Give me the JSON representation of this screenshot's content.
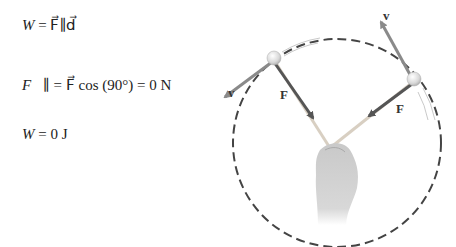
{
  "equations": {
    "eq1": {
      "lhs": "W",
      "rhs": "= F⃗∥d⃗"
    },
    "eq2": {
      "lhs": "F⃗∥",
      "rhs": "= F⃗ cos (90°) = 0 N"
    },
    "eq3": {
      "lhs": "W",
      "rhs": "= 0 J"
    }
  },
  "diagram": {
    "labels": {
      "v_left": "v⃗",
      "v_right": "v⃗",
      "F_left": "F⃗",
      "F_right": "F⃗"
    },
    "colors": {
      "circle": "#444444",
      "velocity_arrow": "#8a8a8a",
      "force_arrow": "#555555",
      "string": "#d8cfc2",
      "ball": "#e6e6e6"
    }
  }
}
